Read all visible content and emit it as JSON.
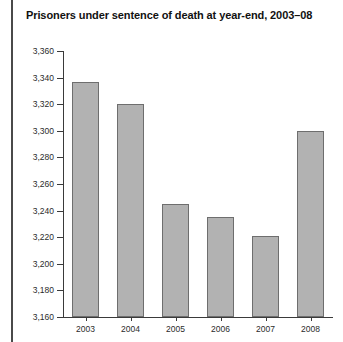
{
  "chart_data": {
    "type": "bar",
    "title": "Prisoners under sentence of death at year-end, 2003–08",
    "xlabel": "",
    "ylabel": "",
    "categories": [
      "2003",
      "2004",
      "2005",
      "2006",
      "2007",
      "2008"
    ],
    "values": [
      3337,
      3320,
      3245,
      3235,
      3221,
      3300
    ],
    "ylim": [
      3160,
      3360
    ],
    "ytick_values": [
      3160,
      3180,
      3200,
      3220,
      3240,
      3260,
      3280,
      3300,
      3320,
      3340,
      3360
    ],
    "ytick_labels": [
      "3,160",
      "3,180",
      "3,200",
      "3,220",
      "3,240",
      "3,260",
      "3,280",
      "3,300",
      "3,320",
      "3,340",
      "3,360"
    ],
    "grid": false,
    "legend": null,
    "bar_color": "#b2b2b2",
    "bar_edge_color": "#6e6e6e",
    "axis_color": "#3a3a3a",
    "text_color": "#2b2b2b",
    "title_color": "#111111",
    "rule_color": "#4a4a4a",
    "background": "#ffffff"
  }
}
